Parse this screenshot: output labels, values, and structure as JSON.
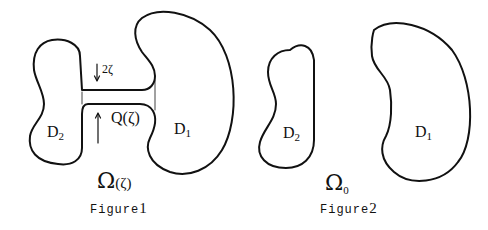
{
  "figure1": {
    "domain_left": {
      "label": "D",
      "subscript": "2"
    },
    "domain_right": {
      "label": "D",
      "subscript": "1"
    },
    "channel_label": "Q(ζ)",
    "channel_width_label": "2ζ",
    "region_symbol": "Ω",
    "region_arg": "(ζ)",
    "caption_text": "Figure",
    "caption_number": "1"
  },
  "figure2": {
    "domain_left": {
      "label": "D",
      "subscript": "2"
    },
    "domain_right": {
      "label": "D",
      "subscript": "1"
    },
    "region_symbol": "Ω",
    "region_subscript": "0",
    "caption_text": "Figure",
    "caption_number": "2"
  }
}
